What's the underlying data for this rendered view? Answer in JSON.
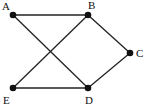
{
  "graph": {
    "nodes": [
      {
        "id": "A",
        "label": "A",
        "x": 13,
        "y": 15,
        "lx": 2,
        "ly": 10
      },
      {
        "id": "B",
        "label": "B",
        "x": 88,
        "y": 15,
        "lx": 88,
        "ly": 9
      },
      {
        "id": "C",
        "label": "C",
        "x": 130,
        "y": 53,
        "lx": 136,
        "ly": 57
      },
      {
        "id": "E",
        "label": "E",
        "x": 13,
        "y": 88,
        "lx": 3,
        "ly": 104
      },
      {
        "id": "D",
        "label": "D",
        "x": 88,
        "y": 88,
        "lx": 85,
        "ly": 104
      }
    ],
    "edges": [
      [
        "A",
        "B"
      ],
      [
        "A",
        "D"
      ],
      [
        "B",
        "E"
      ],
      [
        "B",
        "C"
      ],
      [
        "C",
        "D"
      ],
      [
        "E",
        "D"
      ]
    ],
    "colors": {
      "stroke": "#222222",
      "node": "#111111"
    }
  }
}
